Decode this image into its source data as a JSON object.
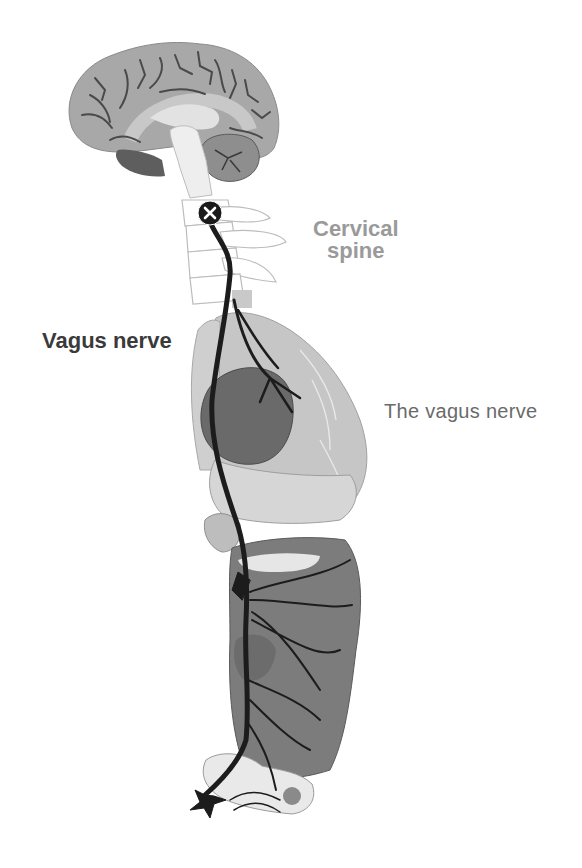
{
  "diagram": {
    "title": "The vagus nerve",
    "labels": {
      "cervical_spine_line1": "Cervical",
      "cervical_spine_line2": "spine",
      "vagus_nerve": "Vagus nerve",
      "caption": "The vagus nerve"
    },
    "marker": {
      "symbol": "x",
      "meaning": "vagus nerve origin"
    },
    "structures": [
      "brain",
      "brainstem",
      "cervical-spine",
      "lungs",
      "heart",
      "diaphragm",
      "liver",
      "stomach",
      "intestines",
      "pelvic-organs",
      "vagus-nerve"
    ],
    "colors": {
      "background": "#ffffff",
      "nerve": "#1c1c1c",
      "brain": "#a8a8a8",
      "brain_sulci": "#4a4a4a",
      "lung": "#c6c6c6",
      "heart": "#6a6a6a",
      "organs_light": "#d6d6d6",
      "abdomen": "#7c7c7c",
      "cervical_label": "#9a9a9a",
      "vagus_label": "#3a3a3a",
      "caption": "#6a6a6a"
    }
  }
}
